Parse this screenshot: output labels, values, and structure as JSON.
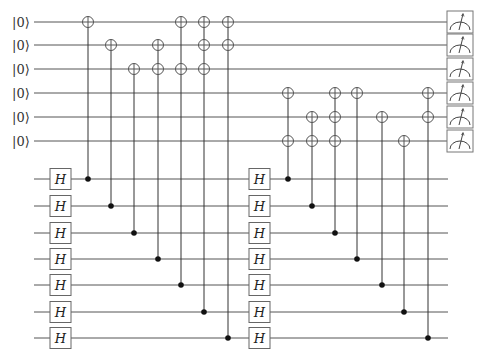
{
  "diagram": {
    "type": "quantum-circuit",
    "ancilla_label": "|0⟩",
    "gate_label": "H",
    "colors": {
      "wire": "#555555",
      "control": "#111111",
      "box": "#666666",
      "background": "#ffffff"
    },
    "ancilla_wires": {
      "count": 6,
      "y": [
        22,
        45,
        69,
        93,
        117,
        141
      ],
      "x_start": 34,
      "x_end": 447,
      "label_x": 12
    },
    "data_wires": {
      "count": 7,
      "y": [
        179,
        206,
        233,
        259,
        285,
        312,
        338
      ],
      "x_start": 34,
      "x_end": 448
    },
    "h_gate_columns": [
      {
        "x": 50,
        "width": 21,
        "height": 21
      },
      {
        "x": 249,
        "width": 21,
        "height": 21
      }
    ],
    "cnot_columns": [
      {
        "x": 88,
        "control": 0,
        "targets": [
          0
        ]
      },
      {
        "x": 111,
        "control": 1,
        "targets": [
          1
        ]
      },
      {
        "x": 134,
        "control": 2,
        "targets": [
          2
        ]
      },
      {
        "x": 158,
        "control": 3,
        "targets": [
          1,
          2
        ]
      },
      {
        "x": 181,
        "control": 4,
        "targets": [
          0,
          2
        ]
      },
      {
        "x": 204,
        "control": 5,
        "targets": [
          0,
          1,
          2
        ]
      },
      {
        "x": 228,
        "control": 6,
        "targets": [
          0,
          1
        ]
      },
      {
        "x": 288,
        "control": 0,
        "targets": [
          3,
          5
        ]
      },
      {
        "x": 312,
        "control": 1,
        "targets": [
          4,
          5
        ]
      },
      {
        "x": 335,
        "control": 2,
        "targets": [
          3,
          4,
          5
        ]
      },
      {
        "x": 357,
        "control": 3,
        "targets": [
          3
        ]
      },
      {
        "x": 382,
        "control": 4,
        "targets": [
          4
        ]
      },
      {
        "x": 404,
        "control": 5,
        "targets": [
          5
        ]
      },
      {
        "x": 428,
        "control": 6,
        "targets": [
          3,
          4
        ]
      }
    ],
    "measurements": {
      "x": 447,
      "width": 26,
      "height": 22,
      "icon": "meter-icon"
    }
  }
}
